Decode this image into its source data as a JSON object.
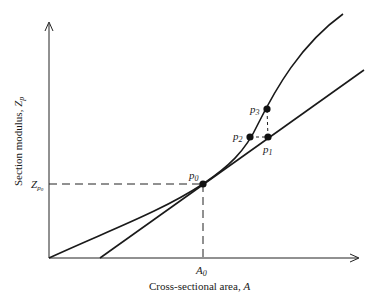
{
  "diagram": {
    "x_axis_label": "Cross-sectional area, ",
    "x_axis_var": "A",
    "y_axis_label": "Section modulus, ",
    "y_axis_var": "Z",
    "y_axis_var_sub": "p",
    "x_tick_label": "A",
    "x_tick_sub": "0",
    "y_tick_label": "Z",
    "y_tick_sub": "p",
    "y_tick_subsub": "0",
    "points": [
      {
        "name": "p",
        "sub": "0"
      },
      {
        "name": "p",
        "sub": "1"
      },
      {
        "name": "p",
        "sub": "2"
      },
      {
        "name": "p",
        "sub": "3"
      }
    ]
  }
}
